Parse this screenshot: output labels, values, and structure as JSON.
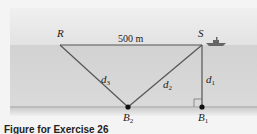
{
  "diagram": {
    "points": {
      "R": "R",
      "S": "S",
      "B1": {
        "base": "B",
        "sub": "1"
      },
      "B2": {
        "base": "B",
        "sub": "2"
      }
    },
    "segments": {
      "d1": {
        "base": "d",
        "sub": "1"
      },
      "d2": {
        "base": "d",
        "sub": "2"
      },
      "d3": {
        "base": "d",
        "sub": "3"
      }
    },
    "surface_distance": "500 m",
    "icons": [
      "ship-icon",
      "right-angle-marker"
    ]
  },
  "caption": "Figure for Exercise 26"
}
